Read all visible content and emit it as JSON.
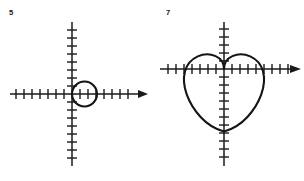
{
  "sheet": {
    "background_color": "#ffffff",
    "ink_color": "#141414",
    "width": 304,
    "height": 181
  },
  "figures": [
    {
      "label": "5",
      "name": "circle-figure",
      "curve_kind": "circle",
      "description": "Circle tangent to the y-axis at the origin, lying in the right half-plane",
      "origin": {
        "x": 72,
        "y": 94
      },
      "tick_spacing": 8,
      "axes": {
        "x_axis": {
          "label": "",
          "left_end": 10,
          "right_end": 148,
          "arrow_at": "right",
          "ticks_left_of_origin": 7,
          "ticks_right_of_origin": 7
        },
        "y_axis": {
          "label": "",
          "top_end": 22,
          "bottom_end": 166,
          "arrow_at": "none",
          "ticks_above_origin": 8,
          "ticks_below_origin": 8
        }
      },
      "curve": {
        "center": {
          "x": 84,
          "y": 94
        },
        "radius": 12.5,
        "tangent_point": {
          "x": 72,
          "y": 94
        },
        "rightmost_point": {
          "x": 96.5,
          "y": 94
        }
      }
    },
    {
      "label": "7",
      "name": "cardioid-figure",
      "curve_kind": "cardioid",
      "description": "Cardioid with cusp at the origin, opening downward below the x-axis",
      "origin": {
        "x": 72,
        "y": 69
      },
      "tick_spacing": 8,
      "axes": {
        "x_axis": {
          "label": "",
          "left_end": 8,
          "right_end": 148,
          "arrow_at": "right",
          "ticks_left_of_origin": 7,
          "ticks_right_of_origin": 8
        },
        "y_axis": {
          "label": "",
          "top_end": 22,
          "bottom_end": 166,
          "arrow_at": "none",
          "ticks_above_origin": 5,
          "ticks_below_origin": 11
        }
      },
      "curve": {
        "cusp": {
          "x": 72,
          "y": 69
        },
        "scale": 20.5,
        "leftmost_point": {
          "x": 33,
          "y": 78
        },
        "rightmost_point": {
          "x": 111,
          "y": 78
        },
        "lowest_point": {
          "x": 72,
          "y": 135
        }
      }
    }
  ]
}
